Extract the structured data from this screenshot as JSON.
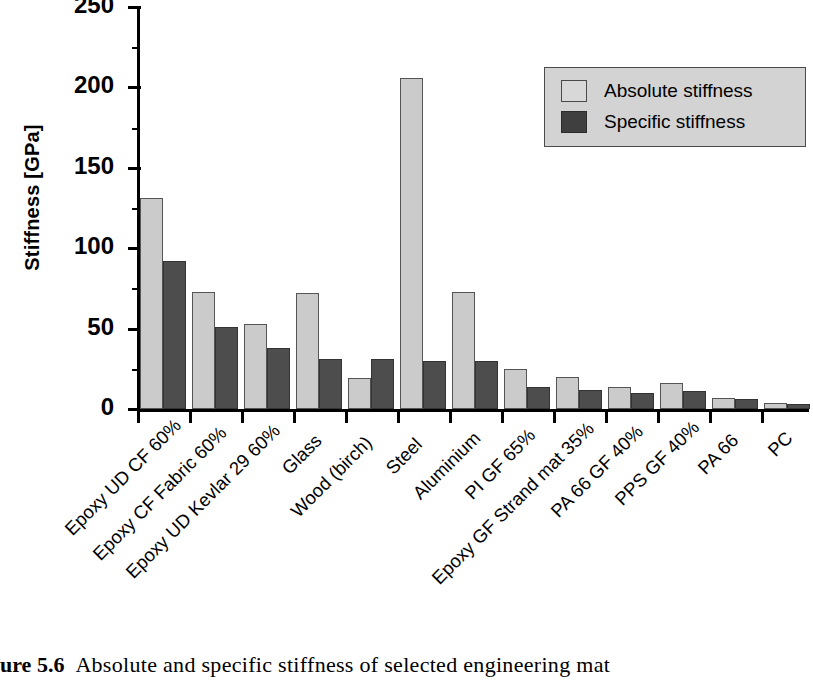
{
  "figure": {
    "caption_prefix": "ure",
    "caption_number": "5.6",
    "caption_text": "Absolute and specific stiffness of selected engineering mat"
  },
  "axes": {
    "y_title": "Stiffness [GPa]",
    "y_ticks": [
      "0",
      "50",
      "100",
      "150",
      "200",
      "250"
    ],
    "y_min": 0,
    "y_max": 250
  },
  "legend": {
    "items": [
      {
        "label": "Absolute stiffness",
        "swatch": "light-gray",
        "color": "#d8d8d8"
      },
      {
        "label": "Specific stiffness",
        "swatch": "dark-gray",
        "color": "#3f3f3f"
      }
    ]
  },
  "chart_data": {
    "type": "bar",
    "xlabel": "",
    "ylabel": "Stiffness [GPa]",
    "ylim": [
      0,
      250
    ],
    "yticks": [
      0,
      50,
      100,
      150,
      200,
      250
    ],
    "grid": false,
    "legend_position": "upper right",
    "categories": [
      "Epoxy UD CF 60%",
      "Epoxy CF Fabric 60%",
      "Epoxy UD Kevlar 29 60%",
      "Glass",
      "Wood (birch)",
      "Steel",
      "Aluminium",
      "PI GF 65%",
      "Epoxy GF Strand mat 35%",
      "PA 66 GF 40%",
      "PPS GF 40%",
      "PA 66",
      "PC"
    ],
    "series": [
      {
        "name": "Absolute stiffness",
        "color": "#cbcbcb",
        "values": [
          131,
          73,
          53,
          72,
          19,
          206,
          73,
          25,
          20,
          14,
          16,
          7,
          4
        ]
      },
      {
        "name": "Specific stiffness",
        "color": "#4d4d4d",
        "values": [
          92,
          51,
          38,
          31,
          31,
          30,
          30,
          14,
          12,
          10,
          11,
          6,
          3
        ]
      }
    ]
  }
}
